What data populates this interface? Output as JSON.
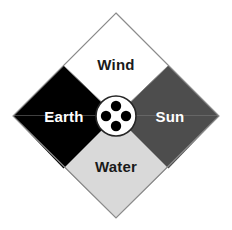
{
  "diagram": {
    "shape": "diamond",
    "background_color": "#ffffff",
    "center": {
      "x": 116,
      "y": 116
    },
    "bounds": {
      "left": 13,
      "top": 13,
      "right": 219,
      "bottom": 218
    },
    "outline_color": "#808080",
    "quadrants": [
      {
        "id": "wind",
        "position": "top",
        "label": "Wind",
        "fill_color": "#ffffff",
        "text_color": "#1a1a1a",
        "label_x": 116,
        "label_y": 66
      },
      {
        "id": "earth",
        "position": "left",
        "label": "Earth",
        "fill_color": "#000000",
        "text_color": "#ffffff",
        "label_x": 64,
        "label_y": 118
      },
      {
        "id": "sun",
        "position": "right",
        "label": "Sun",
        "fill_color": "#4d4d4d",
        "text_color": "#ffffff",
        "label_x": 170,
        "label_y": 118
      },
      {
        "id": "water",
        "position": "bottom",
        "label": "Water",
        "fill_color": "#d9d9d9",
        "text_color": "#1a1a1a",
        "label_x": 116,
        "label_y": 168
      }
    ],
    "hub": {
      "id": "center-hub",
      "shape": "circle",
      "cx": 116,
      "cy": 116,
      "radius": 20,
      "fill_color": "#ffffff",
      "stroke_color": "#262626",
      "dot_color": "#000000",
      "dot_radius": 5.2,
      "dots": [
        {
          "id": "hub-dot-top",
          "cx": 116,
          "cy": 106
        },
        {
          "id": "hub-dot-left",
          "cx": 106,
          "cy": 116
        },
        {
          "id": "hub-dot-right",
          "cx": 126,
          "cy": 116
        },
        {
          "id": "hub-dot-bottom",
          "cx": 116,
          "cy": 126
        }
      ]
    }
  }
}
